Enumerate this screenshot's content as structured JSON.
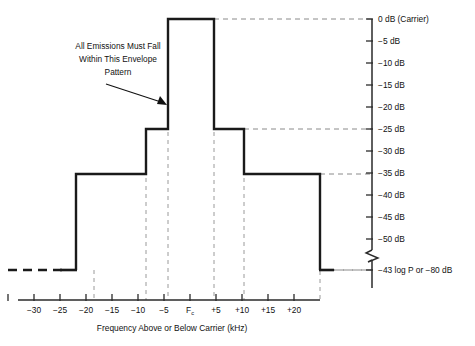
{
  "chart_data": {
    "type": "line",
    "title": "",
    "xlabel": "Frequency Above or Below Carrier (kHz)",
    "ylabel": "",
    "xlim": [
      -37,
      27
    ],
    "ylim": [
      -85,
      2
    ],
    "grid": "dashed guide lines at envelope corners",
    "legend": "none",
    "x_ticks": [
      -35,
      -30,
      -25,
      -20,
      -15,
      -10,
      -5,
      0,
      5,
      10,
      15,
      20
    ],
    "x_tick_labels": [
      "",
      "-30",
      "-25",
      "-20",
      "-15",
      "-10",
      "-5",
      "Fc",
      "+5",
      "+10",
      "+15",
      "+20"
    ],
    "y_ticks": [
      0,
      -5,
      -10,
      -15,
      -20,
      -25,
      -30,
      -35,
      -40,
      -45,
      -50,
      -80
    ],
    "y_tick_labels": [
      "0 dB (Carrier)",
      "-5 dB",
      "-10 dB",
      "-15 dB",
      "-20 dB",
      "-25 dB",
      "-30 dB",
      "-35 dB",
      "-40 dB",
      "-45 dB",
      "-50 dB",
      "-43 log P or  -80 dB"
    ],
    "axis_break": true,
    "axis_break_between": [
      -50,
      -80
    ],
    "envelope_steps": [
      {
        "from_khz": -25,
        "to_khz": -10,
        "level_db": -35
      },
      {
        "from_khz": -10,
        "to_khz": -5,
        "level_db": -25
      },
      {
        "from_khz": -5,
        "to_khz": 5,
        "level_db": 0
      },
      {
        "from_khz": 5,
        "to_khz": 10,
        "level_db": -25
      },
      {
        "from_khz": 10,
        "to_khz": 25,
        "level_db": -35
      }
    ],
    "tails": [
      {
        "side": "left",
        "beyond_khz": -25,
        "level_db": -80,
        "style": "dashed"
      },
      {
        "side": "right",
        "beyond_khz": 25,
        "level_db": -80,
        "style": "solid-then-dashed"
      }
    ],
    "guide_levels_db": [
      0,
      -25,
      -35,
      -80
    ],
    "guide_freqs_khz": [
      -25,
      -10,
      -5,
      5,
      10,
      25
    ]
  },
  "annotation": {
    "line1": "All Emissions Must Fall",
    "line2": "Within This Envelope",
    "line3": "Pattern",
    "points_to": "envelope rising edge at -5 kHz"
  },
  "axis_title": {
    "text": "Frequency Above or Below Carrier (kHz)"
  },
  "carrier_tick": {
    "base": "F",
    "subscript": "c"
  },
  "colors": {
    "envelope": "#1a1a1a",
    "guide": "#8a8a8a",
    "axis": "#2a2a2a",
    "text": "#111111",
    "background": "#ffffff"
  }
}
